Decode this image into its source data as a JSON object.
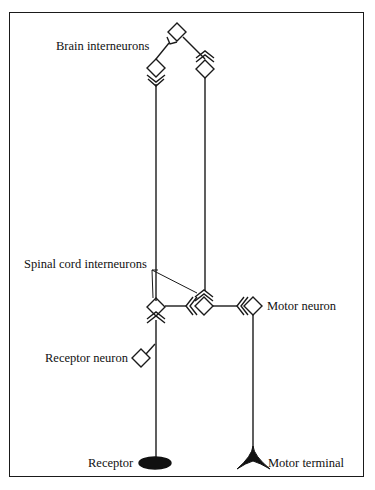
{
  "diagram": {
    "type": "neural reflex pathway",
    "labels": {
      "brain_interneurons": "Brain interneurons",
      "spinal_cord_interneurons": "Spinal cord interneurons",
      "motor_neuron": "Motor neuron",
      "receptor_neuron": "Receptor neuron",
      "receptor": "Receptor",
      "motor_terminal": "Motor terminal"
    },
    "nodes": [
      {
        "id": "brain-top",
        "kind": "interneuron",
        "shape": "diamond"
      },
      {
        "id": "brain-left",
        "kind": "interneuron",
        "shape": "diamond"
      },
      {
        "id": "brain-right",
        "kind": "interneuron",
        "shape": "diamond"
      },
      {
        "id": "spinal-left",
        "kind": "interneuron",
        "shape": "diamond"
      },
      {
        "id": "spinal-right",
        "kind": "interneuron",
        "shape": "diamond"
      },
      {
        "id": "motor-neuron",
        "kind": "motor neuron",
        "shape": "diamond"
      },
      {
        "id": "receptor-neuron",
        "kind": "sensory neuron",
        "shape": "diamond"
      },
      {
        "id": "receptor",
        "kind": "receptor",
        "shape": "ellipse"
      },
      {
        "id": "motor-terminal",
        "kind": "effector",
        "shape": "triangle"
      }
    ],
    "colors": {
      "stroke": "#1a1a1a",
      "background": "#ffffff"
    }
  }
}
